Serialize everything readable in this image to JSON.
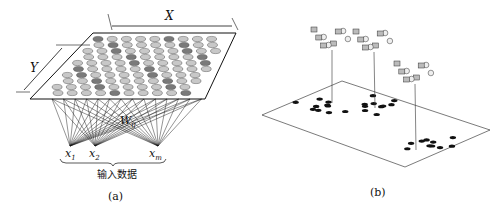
{
  "panel_a": {
    "x_axis_label": "X",
    "y_axis_label": "Y",
    "weight_label": "W",
    "weight_sub": "ij",
    "inputs": [
      {
        "name": "x",
        "sub": "1"
      },
      {
        "name": "x",
        "sub": "2"
      },
      {
        "name": "x",
        "sub": "m"
      }
    ],
    "input_group_label": "输入数据",
    "caption": "(a)"
  },
  "panel_b": {
    "caption": "(b)",
    "clusters": 3
  },
  "colors": {
    "line": "#111111",
    "node_light": "#c8c8c8",
    "node_dark": "#7a7a7a"
  }
}
